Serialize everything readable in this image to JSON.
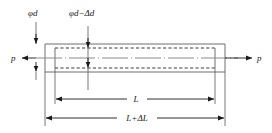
{
  "figure": {
    "kind": "engineering-diagram",
    "background_color": "#ffffff",
    "line_color": "#1a1a1a",
    "body_line_color": "#6b6b6b",
    "dashed_line_color": "#4a4a4a"
  },
  "labels": {
    "diameter_original": "φd",
    "diameter_reduced": "φd−Δd",
    "force_left": "p",
    "force_right": "p",
    "length_original": "L",
    "length_extended": "L+ΔL"
  },
  "icons": {
    "arrow_left": "arrowhead-left",
    "arrow_right": "arrowhead-right",
    "arrow_up": "arrowhead-up",
    "arrow_down": "arrowhead-down"
  },
  "geometry": {
    "bar_outer": {
      "x1": 45,
      "y1": 44,
      "x2": 225,
      "y2": 72
    },
    "bar_inner": {
      "x1": 55,
      "y1": 48,
      "x2": 215,
      "y2": 68
    },
    "axis_y": 58,
    "dim_length_original": {
      "x1": 55,
      "x2": 215,
      "y": 99
    },
    "dim_length_extended": {
      "x1": 45,
      "x2": 225,
      "y": 118
    },
    "dim_diameter_original_x": 36,
    "dim_diameter_reduced_x": 88
  }
}
